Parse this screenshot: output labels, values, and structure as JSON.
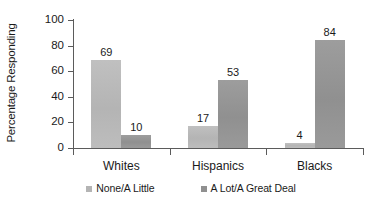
{
  "chart_data": {
    "type": "bar",
    "title": "",
    "subtitle": "",
    "xlabel": "",
    "ylabel": "Percentage Responding",
    "categories": [
      "Whites",
      "Hispanics",
      "Blacks"
    ],
    "series": [
      {
        "name": "None/A Little",
        "values": [
          69,
          17,
          4
        ],
        "color": "#b4b4b4"
      },
      {
        "name": "A Lot/A Great Deal",
        "values": [
          10,
          53,
          84
        ],
        "color": "#909090"
      }
    ],
    "ylim": [
      0,
      100
    ],
    "yticks": [
      0,
      20,
      40,
      60,
      80,
      100
    ],
    "ytick_labels": [
      "0",
      "20",
      "40",
      "60",
      "80",
      "100"
    ],
    "grid": false,
    "legend_position": "bottom",
    "data_labels": [
      "69",
      "10",
      "17",
      "53",
      "4",
      "84"
    ]
  },
  "axis": {
    "y_title": "Percentage Responding"
  },
  "legend": {
    "items": [
      {
        "label": "None/A Little"
      },
      {
        "label": "A Lot/A Great Deal"
      }
    ]
  }
}
